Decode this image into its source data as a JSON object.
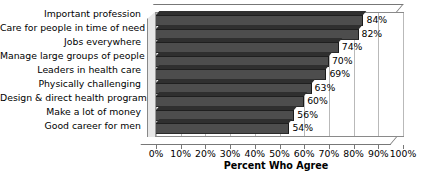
{
  "chart_data": {
    "type": "bar",
    "orientation": "horizontal",
    "title": "",
    "xlabel": "Percent Who Agree",
    "ylabel": "",
    "xlim": [
      0,
      100
    ],
    "xticks": [
      "0%",
      "10%",
      "20%",
      "30%",
      "40%",
      "50%",
      "60%",
      "70%",
      "80%",
      "90%",
      "100%"
    ],
    "grid": true,
    "legend": false,
    "style": "3d",
    "categories": [
      "Important profession",
      "Care for people in time of need",
      "Jobs everywhere",
      "Manage large groups of people",
      "Leaders in health care",
      "Physically challenging",
      "Design & direct health programs",
      "Make a lot of money",
      "Good career for men"
    ],
    "values": [
      84,
      82,
      74,
      70,
      69,
      63,
      60,
      56,
      54
    ],
    "data_labels": [
      "84%",
      "82%",
      "74%",
      "70%",
      "69%",
      "63%",
      "60%",
      "56%",
      "54%"
    ],
    "colors": {
      "bar_fill": "#4d4d4d",
      "bar_top": "#2f2f2f",
      "bar_edge": "#1f1f1f",
      "gridline": "#b9b9b9",
      "plot_background": "#ffffff",
      "axis_line": "#8a8a8a",
      "text": "#000000"
    }
  }
}
